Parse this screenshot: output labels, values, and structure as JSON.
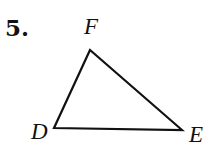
{
  "problem": {
    "number": "5.",
    "figure": "triangle",
    "vertices": [
      {
        "label": "F",
        "x": 90,
        "y": 50
      },
      {
        "label": "D",
        "x": 54,
        "y": 128
      },
      {
        "label": "E",
        "x": 182,
        "y": 130
      }
    ]
  }
}
